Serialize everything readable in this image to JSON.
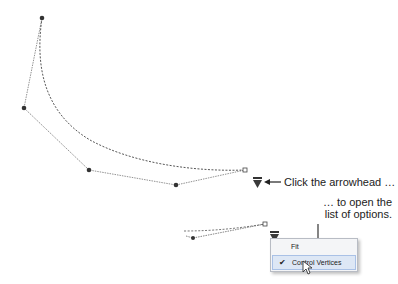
{
  "annotations": {
    "click_arrowhead": "Click the arrowhead …",
    "open_list_line1": "… to open the",
    "open_list_line2": "list of options."
  },
  "menu": {
    "items": [
      {
        "label": "Fit",
        "checked": false
      },
      {
        "label": "Control Vertices",
        "checked": true,
        "hovered": true
      }
    ],
    "check_glyph": "✔"
  },
  "diagram": {
    "upper_curve": {
      "control_vertices": [
        [
          42,
          18
        ],
        [
          24,
          108
        ],
        [
          89,
          170
        ],
        [
          176,
          185
        ],
        [
          245,
          170
        ]
      ],
      "end_marker": "square"
    },
    "lower_curve": {
      "control_vertices": [
        [
          193,
          238
        ],
        [
          265,
          224
        ]
      ],
      "end_marker": "square"
    },
    "colors": {
      "line": "#555555",
      "vertex": "#333333",
      "arrowhead": "#3a3a3a"
    }
  }
}
